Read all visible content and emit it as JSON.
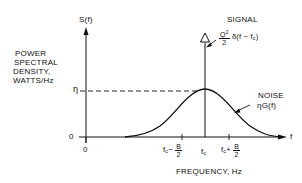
{
  "diagram": {
    "type": "power-spectral-density-plot",
    "y_axis": {
      "symbol": "S(f)",
      "title_lines": [
        "POWER",
        "SPECTRAL",
        "DENSITY,",
        "WATTS/Hz"
      ],
      "ticks": [
        {
          "label": "η",
          "meaning": "noise density level (dashed reference)"
        },
        {
          "label": "0"
        }
      ]
    },
    "x_axis": {
      "symbol": "f",
      "title": "FREQUENCY, Hz",
      "ticks": [
        {
          "label": "0"
        },
        {
          "label_main": "f",
          "label_sub": "c",
          "label_op": "−",
          "frac_num": "B",
          "frac_den": "2"
        },
        {
          "label_main": "f",
          "label_sub": "c"
        },
        {
          "label_main": "f",
          "label_sub": "c",
          "label_op": "+",
          "frac_num": "B",
          "frac_den": "2"
        }
      ]
    },
    "signal": {
      "title": "SIGNAL",
      "coef_num": "Q",
      "coef_num_sup": "2",
      "coef_den": "2",
      "delta": "δ(f − f",
      "delta_sub": "c",
      "delta_close": ")",
      "marker": "triangle-impulse"
    },
    "noise": {
      "title": "NOISE",
      "expr": "ηG(f)",
      "shape": "bell curve centered at fc, peak = η"
    }
  }
}
